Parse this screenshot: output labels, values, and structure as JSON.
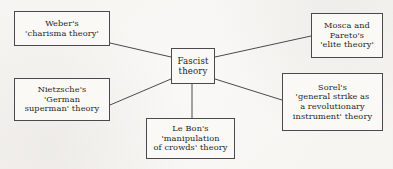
{
  "diagram": {
    "type": "concept-map",
    "title": "Fascist theory",
    "canvas": {
      "width": 393,
      "height": 169
    },
    "colors": {
      "background": "#f7f6f3",
      "node_fill": "#faf9f6",
      "node_border": "#4a4a4a",
      "edge": "#4a4a4a",
      "text": "#1f1f1f"
    },
    "center": {
      "id": "center",
      "label": "Fascist\ntheory"
    },
    "nodes": [
      {
        "id": "weber",
        "label": "Weber's\n'charisma theory'",
        "position": "top-left"
      },
      {
        "id": "nietzsche",
        "label": "Nietzsche's\n'German\nsuperman' theory",
        "position": "bottom-left"
      },
      {
        "id": "mosca",
        "label": "Mosca and\nPareto's\n'elite theory'",
        "position": "top-right"
      },
      {
        "id": "sorel",
        "label": "Sorel's\n'general strike as\na revolutionary\ninstrument' theory",
        "position": "bottom-right"
      },
      {
        "id": "lebon",
        "label": "Le Bon's\n'manipulation\nof crowds' theory",
        "position": "bottom-center"
      }
    ],
    "edges": [
      {
        "id": "edge-weber-center",
        "from": "weber",
        "to": "center"
      },
      {
        "id": "edge-nietzsche-center",
        "from": "nietzsche",
        "to": "center"
      },
      {
        "id": "edge-center-mosca",
        "from": "center",
        "to": "mosca"
      },
      {
        "id": "edge-center-sorel",
        "from": "center",
        "to": "sorel"
      },
      {
        "id": "edge-center-lebon",
        "from": "center",
        "to": "lebon"
      }
    ]
  }
}
